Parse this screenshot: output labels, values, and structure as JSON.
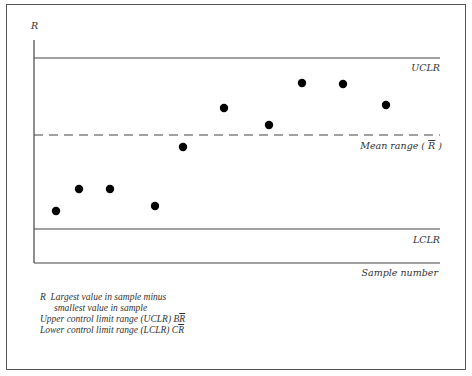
{
  "chart_data": {
    "type": "scatter",
    "title": "",
    "ylabel": "R",
    "xlabel": "Sample number",
    "grid": false,
    "x": [
      1,
      2,
      3,
      4,
      5,
      6,
      7,
      8,
      9,
      10
    ],
    "series": [
      {
        "name": "Sample range R",
        "values": [
          52,
          74,
          74,
          57,
          116,
          155,
          138,
          180,
          179,
          158
        ]
      }
    ],
    "reference_lines": [
      {
        "name": "UCLR",
        "label": "UCLR",
        "value": 205,
        "style": "solid"
      },
      {
        "name": "Mean range",
        "label": "Mean range ( R̄ )",
        "value": 128,
        "style": "dashed"
      },
      {
        "name": "LCLR",
        "label": "LCLR",
        "value": 34,
        "style": "solid"
      }
    ],
    "ylim": [
      0,
      223
    ],
    "note": "Values are relative units estimated from pixel positions; axes have no numeric ticks."
  },
  "labels": {
    "y_axis": "R",
    "uclr": "UCLR",
    "mean_prefix": "Mean range ( ",
    "mean_symbol": "R",
    "mean_suffix": " )",
    "lclr": "LCLR",
    "x_axis": "Sample number"
  },
  "legend": {
    "r_symbol": "R",
    "r_line1": "Largest value in sample minus",
    "r_line2": "smallest value in sample",
    "uclr_text": "Upper control limit range (UCLR) B",
    "uclr_symbol": "R",
    "lclr_text": "Lower control limit range (LCLR) C",
    "lclr_symbol": "R"
  }
}
